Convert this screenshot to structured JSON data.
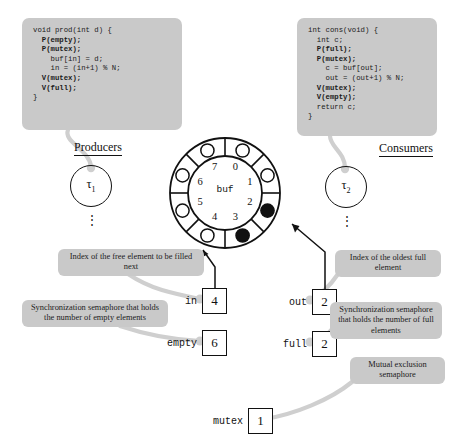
{
  "producer": {
    "heading": "Producers",
    "thread_label": "τ",
    "thread_sub": "1",
    "dots": "⋮",
    "code": [
      {
        "text": "void prod(int d) {",
        "bold": false
      },
      {
        "text": "  P(empty);",
        "bold": true
      },
      {
        "text": "  P(mutex);",
        "bold": true
      },
      {
        "text": "    buf[in] = d;",
        "bold": false
      },
      {
        "text": "    in = (in+1) % N;",
        "bold": false
      },
      {
        "text": "  V(mutex);",
        "bold": true
      },
      {
        "text": "  V(full);",
        "bold": true
      },
      {
        "text": "}",
        "bold": false
      }
    ]
  },
  "consumer": {
    "heading": "Consumers",
    "thread_label": "τ",
    "thread_sub": "2",
    "dots": "⋮",
    "code": [
      {
        "text": "int cons(void) {",
        "bold": false
      },
      {
        "text": "  int c;",
        "bold": false
      },
      {
        "text": "  P(full);",
        "bold": true
      },
      {
        "text": "  P(mutex);",
        "bold": true
      },
      {
        "text": "    c = buf[out];",
        "bold": false
      },
      {
        "text": "    out = (out+1) % N;",
        "bold": false
      },
      {
        "text": "  V(mutex);",
        "bold": true
      },
      {
        "text": "  V(empty);",
        "bold": true
      },
      {
        "text": "  return c;",
        "bold": false
      },
      {
        "text": "}",
        "bold": false
      }
    ]
  },
  "buffer": {
    "name": "buf",
    "slot_count": 8,
    "indices": [
      "0",
      "1",
      "2",
      "3",
      "4",
      "5",
      "6",
      "7"
    ],
    "filled_slots": [
      2,
      3
    ],
    "empty_slots": [
      0,
      1,
      4,
      5,
      6,
      7
    ],
    "fill_color": "#111111",
    "empty_color": "#ffffff"
  },
  "variables": [
    {
      "id": "in",
      "name": "in",
      "value": "4"
    },
    {
      "id": "out",
      "name": "out",
      "value": "2"
    },
    {
      "id": "empty",
      "name": "empty",
      "value": "6"
    },
    {
      "id": "full",
      "name": "full",
      "value": "2"
    },
    {
      "id": "mutex",
      "name": "mutex",
      "value": "1"
    }
  ],
  "callouts": {
    "in": "Index of the free element to be filled next",
    "out": "Index of the oldest full element",
    "empty": "Synchronization semaphore that holds the number of empty elements",
    "full": "Synchronization semaphore that holds the number of full elements",
    "mutex": "Mutual exclusion semaphore"
  },
  "colors": {
    "callout_bg": "#c9c9c9",
    "connector": "#cfcfcf",
    "stroke": "#111111",
    "background": "#ffffff"
  }
}
